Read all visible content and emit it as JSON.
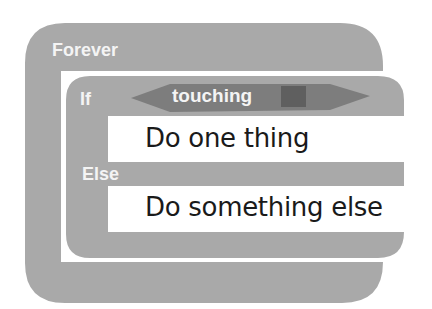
{
  "diagram": {
    "forever_block": {
      "label": "Forever",
      "color": "#a9a9a9"
    },
    "if_block": {
      "label": "If",
      "else_label": "Else",
      "color": "#a9a9a9"
    },
    "condition": {
      "label": "touching",
      "color": "#7d7d7d",
      "swatch_color": "#5f5f5f"
    },
    "then_slot": {
      "text": "Do one thing"
    },
    "else_slot": {
      "text": "Do something else"
    }
  }
}
